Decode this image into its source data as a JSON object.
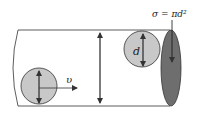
{
  "diagram": {
    "labels": {
      "cross_section": "σ = πd²",
      "diameter": "d",
      "velocity": "υ"
    },
    "colors": {
      "line": "#333333",
      "particle_fill": "#c8c8c8",
      "cross_section_fill": "#6e6e6e",
      "background": "#ffffff"
    }
  }
}
